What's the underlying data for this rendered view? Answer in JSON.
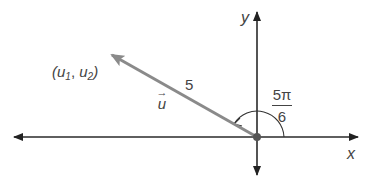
{
  "diagram": {
    "type": "vector-in-coordinate-plane",
    "axes": {
      "x_label": "x",
      "y_label": "y"
    },
    "vector": {
      "name": "u",
      "magnitude_label": "5",
      "endpoint_label": {
        "open": "(",
        "u1_base": "u",
        "u1_sub": "1",
        "sep": ", ",
        "u2_base": "u",
        "u2_sub": "2",
        "close": ")"
      },
      "vector_label": "u",
      "arrow_over": "→"
    },
    "angle": {
      "numerator": "5π",
      "denominator": "6"
    },
    "colors": {
      "axis": "#2a2a2a",
      "vector": "#8a8a8a",
      "text": "#444444"
    }
  }
}
